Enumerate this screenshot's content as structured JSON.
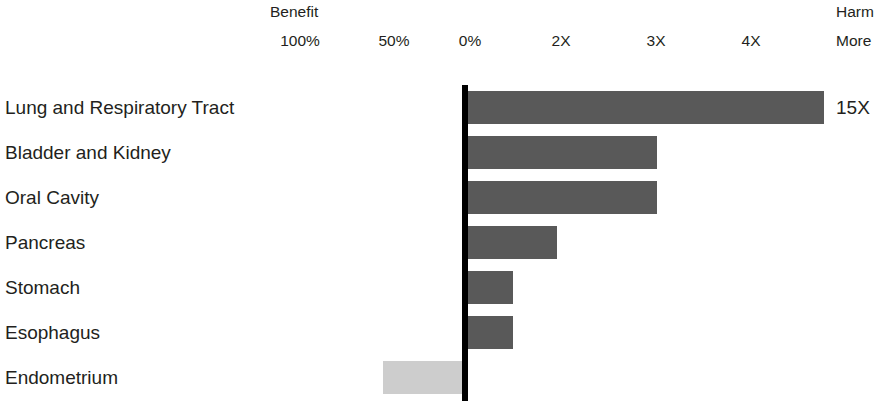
{
  "header": {
    "benefit_label": "Benefit",
    "harm_label": "Harm",
    "more_label": "More"
  },
  "axis": {
    "ticks": [
      {
        "label": "100%",
        "x": 300
      },
      {
        "label": "50%",
        "x": 394
      },
      {
        "label": "0%",
        "x": 470
      },
      {
        "label": "2X",
        "x": 561
      },
      {
        "label": "3X",
        "x": 656
      },
      {
        "label": "4X",
        "x": 751
      }
    ]
  },
  "chart_data": {
    "type": "bar",
    "orientation": "horizontal-diverging",
    "title": "",
    "subtitle": "",
    "xlabel": "",
    "ylabel": "",
    "grid": false,
    "legend_position": "none",
    "axis_tick_labels": [
      "100%",
      "50%",
      "0%",
      "2X",
      "3X",
      "4X"
    ],
    "left_axis_header": "Benefit",
    "right_axis_header": "Harm",
    "right_axis_subheader": "More",
    "zero_label": "0%",
    "categories": [
      "Lung and Respiratory Tract",
      "Bladder and Kidney",
      "Oral Cavity",
      "Pancreas",
      "Stomach",
      "Esophagus",
      "Endometrium"
    ],
    "values": [
      15,
      3,
      3,
      2,
      1.5,
      1.5,
      -0.83
    ],
    "value_units": "X (relative risk multiple)",
    "bars": [
      {
        "category": "Lung and Respiratory Tract",
        "value": 15,
        "direction": "harm",
        "value_label": "15X",
        "bar_left": 468,
        "bar_right": 824,
        "color": "#595959"
      },
      {
        "category": "Bladder and Kidney",
        "value": 3,
        "direction": "harm",
        "value_label": "",
        "bar_left": 468,
        "bar_right": 657,
        "color": "#595959"
      },
      {
        "category": "Oral Cavity",
        "value": 3,
        "direction": "harm",
        "value_label": "",
        "bar_left": 468,
        "bar_right": 657,
        "color": "#595959"
      },
      {
        "category": "Pancreas",
        "value": 2,
        "direction": "harm",
        "value_label": "",
        "bar_left": 468,
        "bar_right": 557,
        "color": "#595959"
      },
      {
        "category": "Stomach",
        "value": 1.5,
        "direction": "harm",
        "value_label": "",
        "bar_left": 468,
        "bar_right": 513,
        "color": "#595959"
      },
      {
        "category": "Esophagus",
        "value": 1.5,
        "direction": "harm",
        "value_label": "",
        "bar_left": 468,
        "bar_right": 513,
        "color": "#595959"
      },
      {
        "category": "Endometrium",
        "value": -0.83,
        "direction": "benefit",
        "value_label": "",
        "bar_left": 383,
        "bar_right": 462,
        "color": "#cdcdcd"
      }
    ],
    "colors": {
      "harm_bar": "#595959",
      "benefit_bar": "#cdcdcd",
      "axis_line": "#000000",
      "text": "#231f20",
      "background": "#ffffff"
    }
  }
}
